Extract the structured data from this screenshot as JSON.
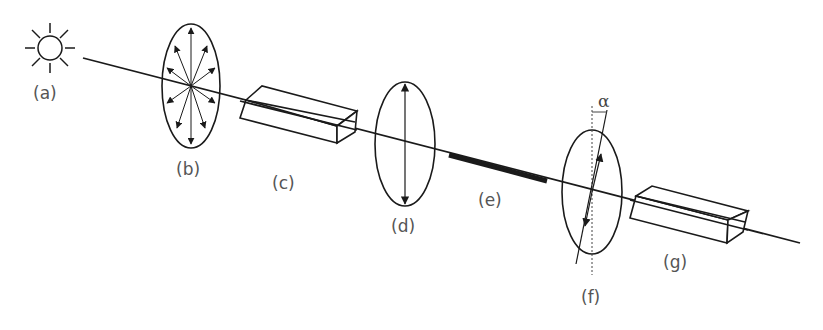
{
  "diagram": {
    "type": "optical-polarimeter-schematic",
    "colors": {
      "line": "#1a1a1a",
      "label": "#555555",
      "background": "#ffffff"
    },
    "components": [
      {
        "id": "a",
        "label": "(a)",
        "icon": "light-source-sun-icon"
      },
      {
        "id": "b",
        "label": "(b)",
        "icon": "unpolarized-light-ellipse-icon"
      },
      {
        "id": "c",
        "label": "(c)",
        "icon": "polarizer-prism-icon"
      },
      {
        "id": "d",
        "label": "(d)",
        "icon": "plane-polarized-light-ellipse-icon"
      },
      {
        "id": "e",
        "label": "(e)",
        "icon": "sample-tube-bar-icon"
      },
      {
        "id": "f",
        "label": "(f)",
        "icon": "rotated-polarized-light-ellipse-icon"
      },
      {
        "id": "g",
        "label": "(g)",
        "icon": "analyzer-prism-icon"
      }
    ],
    "rotation_angle_symbol": "α"
  }
}
